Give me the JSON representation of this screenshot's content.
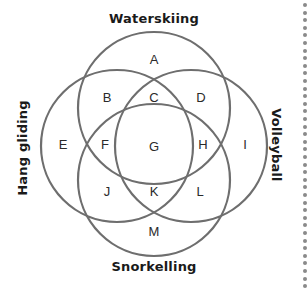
{
  "diagram": {
    "type": "venn-4-set",
    "line_color": "#6e6e6e",
    "sets": [
      {
        "name": "Waterskiing",
        "position": "top",
        "cx": 154,
        "cy": 108,
        "r": 76
      },
      {
        "name": "Hang gliding",
        "position": "left",
        "cx": 117,
        "cy": 146,
        "r": 76
      },
      {
        "name": "Volleyball",
        "position": "right",
        "cx": 191,
        "cy": 146,
        "r": 76
      },
      {
        "name": "Snorkelling",
        "position": "bottom",
        "cx": 154,
        "cy": 180,
        "r": 76
      }
    ],
    "regions": [
      {
        "label": "A",
        "x": 154,
        "y": 59
      },
      {
        "label": "B",
        "x": 107,
        "y": 97
      },
      {
        "label": "C",
        "x": 154,
        "y": 97
      },
      {
        "label": "D",
        "x": 201,
        "y": 97
      },
      {
        "label": "E",
        "x": 63,
        "y": 144
      },
      {
        "label": "F",
        "x": 105,
        "y": 144
      },
      {
        "label": "G",
        "x": 154,
        "y": 146
      },
      {
        "label": "H",
        "x": 203,
        "y": 144
      },
      {
        "label": "I",
        "x": 245,
        "y": 144
      },
      {
        "label": "J",
        "x": 107,
        "y": 191
      },
      {
        "label": "K",
        "x": 154,
        "y": 191
      },
      {
        "label": "L",
        "x": 200,
        "y": 191
      },
      {
        "label": "M",
        "x": 154,
        "y": 231
      }
    ]
  },
  "labels": {
    "top": "Waterskiing",
    "left": "Hang gliding",
    "right": "Volleyball",
    "bottom": "Snorkelling"
  }
}
